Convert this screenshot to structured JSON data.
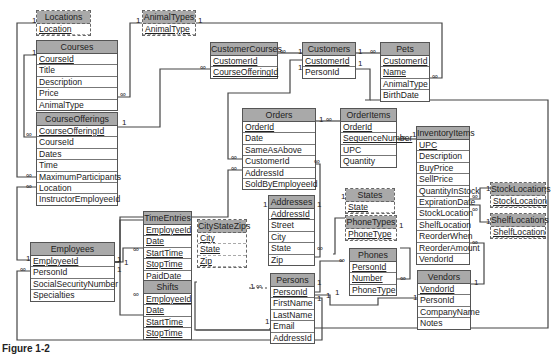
{
  "diagram": {
    "type": "relational-database-schema",
    "caption": "Figure 1-2",
    "tables": [
      {
        "id": "Locations",
        "name": "Locations",
        "lookup": true,
        "fields": [
          {
            "name": "Location",
            "key": true
          }
        ]
      },
      {
        "id": "AnimalTypes",
        "name": "AnimalTypes",
        "lookup": true,
        "fields": [
          {
            "name": "AnimalType",
            "key": true
          }
        ]
      },
      {
        "id": "Courses",
        "name": "Courses",
        "fields": [
          {
            "name": "CourseId",
            "key": true
          },
          {
            "name": "Title"
          },
          {
            "name": "Description"
          },
          {
            "name": "Price"
          },
          {
            "name": "AnimalType"
          }
        ]
      },
      {
        "id": "CourseOfferings",
        "name": "CourseOfferings",
        "fields": [
          {
            "name": "CourseOfferingId",
            "key": true
          },
          {
            "name": "CourseId"
          },
          {
            "name": "Dates"
          },
          {
            "name": "Time"
          },
          {
            "name": "MaximumParticipants"
          },
          {
            "name": "Location"
          },
          {
            "name": "InstructorEmployeeId"
          }
        ]
      },
      {
        "id": "CustomerCourses",
        "name": "CustomerCourses",
        "fields": [
          {
            "name": "CustomerId",
            "key": true
          },
          {
            "name": "CourseOfferingId",
            "key": true
          }
        ]
      },
      {
        "id": "Customers",
        "name": "Customers",
        "fields": [
          {
            "name": "CustomerId",
            "key": true
          },
          {
            "name": "PersonId"
          }
        ]
      },
      {
        "id": "Pets",
        "name": "Pets",
        "fields": [
          {
            "name": "CustomerId",
            "key": true
          },
          {
            "name": "Name",
            "key": true
          },
          {
            "name": "AnimalType"
          },
          {
            "name": "BirthDate"
          }
        ]
      },
      {
        "id": "Orders",
        "name": "Orders",
        "fields": [
          {
            "name": "OrderId",
            "key": true
          },
          {
            "name": "Date"
          },
          {
            "name": "SameAsAbove"
          },
          {
            "name": "CustomerId"
          },
          {
            "name": "AddressId"
          },
          {
            "name": "SoldByEmployeeId"
          }
        ]
      },
      {
        "id": "OrderItems",
        "name": "OrderItems",
        "fields": [
          {
            "name": "OrderId",
            "key": true
          },
          {
            "name": "SequenceNumber",
            "key": true
          },
          {
            "name": "UPC"
          },
          {
            "name": "Quantity"
          }
        ]
      },
      {
        "id": "InventoryItems",
        "name": "InventoryItems",
        "fields": [
          {
            "name": "UPC",
            "key": true
          },
          {
            "name": "Description"
          },
          {
            "name": "BuyPrice"
          },
          {
            "name": "SellPrice"
          },
          {
            "name": "QuantityInStock"
          },
          {
            "name": "ExpirationDate"
          },
          {
            "name": "StockLocation"
          },
          {
            "name": "ShelfLocation"
          },
          {
            "name": "ReorderWhen"
          },
          {
            "name": "ReorderAmount"
          },
          {
            "name": "VendorId"
          }
        ]
      },
      {
        "id": "StockLocations",
        "name": "StockLocations",
        "lookup": true,
        "fields": [
          {
            "name": "StockLocation",
            "key": true
          }
        ]
      },
      {
        "id": "ShelfLocations",
        "name": "ShelfLocations",
        "lookup": true,
        "fields": [
          {
            "name": "ShelfLocation",
            "key": true
          }
        ]
      },
      {
        "id": "Employees",
        "name": "Employees",
        "fields": [
          {
            "name": "EmployeeId",
            "key": true
          },
          {
            "name": "PersonId"
          },
          {
            "name": "SocialSecurityNumber"
          },
          {
            "name": "Specialties"
          }
        ]
      },
      {
        "id": "TimeEntries",
        "name": "TimeEntries",
        "fields": [
          {
            "name": "EmployeeId",
            "key": true
          },
          {
            "name": "Date",
            "key": true
          },
          {
            "name": "StartTime",
            "key": true
          },
          {
            "name": "StopTime",
            "key": true
          },
          {
            "name": "PaidDate"
          }
        ]
      },
      {
        "id": "Shifts",
        "name": "Shifts",
        "fields": [
          {
            "name": "EmployeeId",
            "key": true
          },
          {
            "name": "Date",
            "key": true
          },
          {
            "name": "StartTime",
            "key": true
          },
          {
            "name": "StopTime",
            "key": true
          }
        ]
      },
      {
        "id": "CityStateZips",
        "name": "CityStateZips",
        "lookup": true,
        "fields": [
          {
            "name": "City",
            "key": true
          },
          {
            "name": "State",
            "key": true
          },
          {
            "name": "Zip",
            "key": true
          }
        ]
      },
      {
        "id": "Addresses",
        "name": "Addresses",
        "fields": [
          {
            "name": "AddressId",
            "key": true
          },
          {
            "name": "Street"
          },
          {
            "name": "City"
          },
          {
            "name": "State"
          },
          {
            "name": "Zip"
          }
        ]
      },
      {
        "id": "States",
        "name": "States",
        "lookup": true,
        "fields": [
          {
            "name": "State",
            "key": true
          }
        ]
      },
      {
        "id": "PhoneTypes",
        "name": "PhoneTypes",
        "lookup": true,
        "fields": [
          {
            "name": "PhoneType",
            "key": true
          }
        ]
      },
      {
        "id": "Phones",
        "name": "Phones",
        "fields": [
          {
            "name": "PersonId",
            "key": true
          },
          {
            "name": "Number",
            "key": true
          },
          {
            "name": "PhoneType"
          }
        ]
      },
      {
        "id": "Persons",
        "name": "Persons",
        "fields": [
          {
            "name": "PersonId",
            "key": true
          },
          {
            "name": "FirstName"
          },
          {
            "name": "LastName"
          },
          {
            "name": "Email"
          },
          {
            "name": "AddressId"
          }
        ]
      },
      {
        "id": "Vendors",
        "name": "Vendors",
        "fields": [
          {
            "name": "VendorId",
            "key": true
          },
          {
            "name": "PersonId"
          },
          {
            "name": "CompanyName"
          },
          {
            "name": "Notes"
          }
        ]
      }
    ],
    "relationships": [
      {
        "from": "Locations.Location",
        "to": "CourseOfferings.Location",
        "one": "1",
        "many": "∞"
      },
      {
        "from": "AnimalTypes.AnimalType",
        "to": "Courses.AnimalType",
        "one": "1",
        "many": "∞"
      },
      {
        "from": "AnimalTypes.AnimalType",
        "to": "Pets.AnimalType",
        "one": "1",
        "many": "∞"
      },
      {
        "from": "Courses.CourseId",
        "to": "CourseOfferings.CourseId",
        "one": "1",
        "many": "∞"
      },
      {
        "from": "CourseOfferings.CourseOfferingId",
        "to": "CustomerCourses.CourseOfferingId",
        "one": "1",
        "many": "∞"
      },
      {
        "from": "Customers.CustomerId",
        "to": "CustomerCourses.CustomerId",
        "one": "1",
        "many": "∞"
      },
      {
        "from": "Customers.CustomerId",
        "to": "Pets.CustomerId",
        "one": "1",
        "many": "∞"
      },
      {
        "from": "Customers.CustomerId",
        "to": "Orders.CustomerId",
        "one": "1",
        "many": "∞"
      },
      {
        "from": "Persons.PersonId",
        "to": "Customers.PersonId",
        "one": "1",
        "many": "1"
      },
      {
        "from": "Orders.OrderId",
        "to": "OrderItems.OrderId",
        "one": "1",
        "many": "∞"
      },
      {
        "from": "InventoryItems.UPC",
        "to": "OrderItems.UPC",
        "one": "1",
        "many": "∞"
      },
      {
        "from": "StockLocations.StockLocation",
        "to": "InventoryItems.StockLocation",
        "one": "1",
        "many": "∞"
      },
      {
        "from": "ShelfLocations.ShelfLocation",
        "to": "InventoryItems.ShelfLocation",
        "one": "1",
        "many": "∞"
      },
      {
        "from": "Vendors.VendorId",
        "to": "InventoryItems.VendorId",
        "one": "1",
        "many": "∞"
      },
      {
        "from": "Employees.EmployeeId",
        "to": "CourseOfferings.InstructorEmployeeId",
        "one": "1",
        "many": "∞"
      },
      {
        "from": "Employees.EmployeeId",
        "to": "Orders.SoldByEmployeeId",
        "one": "1",
        "many": "∞"
      },
      {
        "from": "Employees.EmployeeId",
        "to": "TimeEntries.EmployeeId",
        "one": "1",
        "many": "∞"
      },
      {
        "from": "Employees.EmployeeId",
        "to": "Shifts.EmployeeId",
        "one": "1",
        "many": "∞"
      },
      {
        "from": "Persons.PersonId",
        "to": "Employees.PersonId",
        "one": "1",
        "many": "∞"
      },
      {
        "from": "Addresses.AddressId",
        "to": "Orders.AddressId",
        "one": "1",
        "many": "∞"
      },
      {
        "from": "Addresses.AddressId",
        "to": "Persons.AddressId",
        "one": "1",
        "many": "1"
      },
      {
        "from": "CityStateZips.City/State/Zip",
        "to": "Addresses.City/State/Zip",
        "one": "1",
        "many": "∞"
      },
      {
        "from": "States.State",
        "to": "Addresses.State",
        "one": "1",
        "many": "∞"
      },
      {
        "from": "PhoneTypes.PhoneType",
        "to": "Phones.PhoneType",
        "one": "1",
        "many": "∞"
      },
      {
        "from": "Persons.PersonId",
        "to": "Phones.PersonId",
        "one": "1",
        "many": "∞"
      },
      {
        "from": "Persons.PersonId",
        "to": "Vendors.PersonId",
        "one": "1",
        "many": "1"
      }
    ],
    "cardinality_symbols": {
      "one": "1",
      "many": "∞"
    }
  }
}
